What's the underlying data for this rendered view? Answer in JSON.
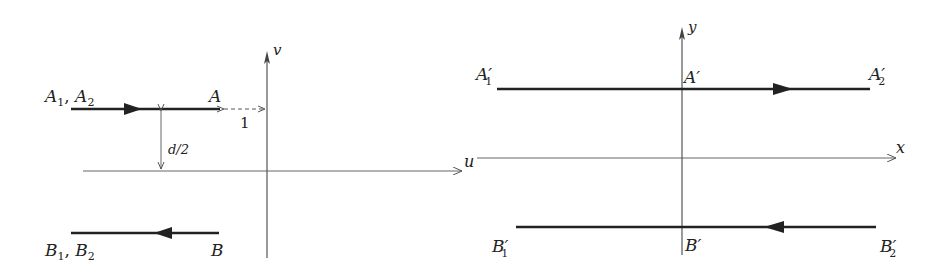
{
  "left_panel": {
    "axes": {
      "horizontal_label": "u",
      "vertical_label": "v"
    },
    "line_A": {
      "start_label": "A",
      "start_sub1": "1",
      "start_sep": ", ",
      "start_label2": "A",
      "start_sub2": "2",
      "end_label": "A",
      "direction": "right"
    },
    "line_B": {
      "start_label": "B",
      "start_sub1": "1",
      "start_sep": ", ",
      "start_label2": "B",
      "start_sub2": "2",
      "end_label": "B",
      "direction": "left"
    },
    "gap_label": "1",
    "distance_label": "d/2"
  },
  "right_panel": {
    "axes": {
      "horizontal_label": "x",
      "vertical_label": "y"
    },
    "line_A_prime": {
      "left_label": "A′",
      "left_sub": "1",
      "mid_label": "A′",
      "right_label": "A′",
      "right_sub": "2",
      "direction": "right"
    },
    "line_B_prime": {
      "left_label": "B′",
      "left_sub": "1",
      "mid_label": "B′",
      "right_label": "B′",
      "right_sub": "2",
      "direction": "left"
    }
  },
  "colors": {
    "thick_line": "#222222",
    "axis_line": "#555555"
  }
}
